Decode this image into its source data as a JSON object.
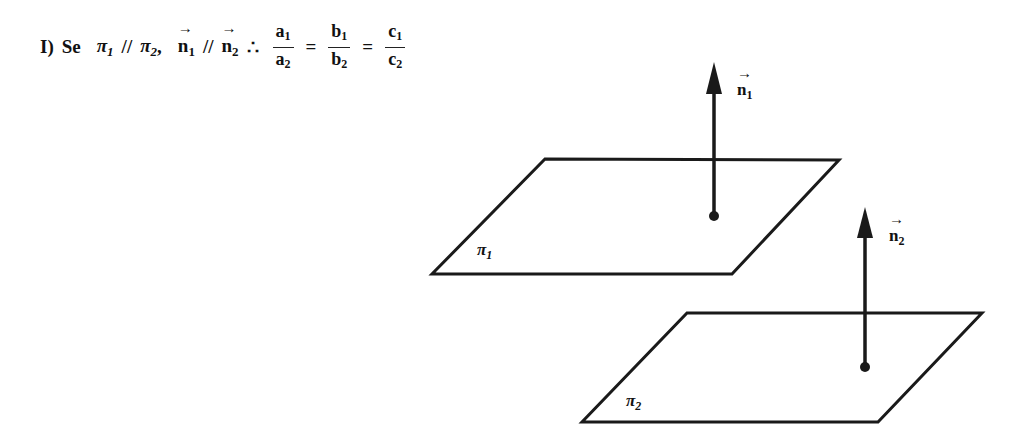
{
  "statement": {
    "item": "I)",
    "word": "Se",
    "pi": "π",
    "sub1": "1",
    "sub2": "2",
    "parallel": "//",
    "comma": ",",
    "normal": "n",
    "therefore": "∴",
    "equals": "=",
    "fractions": [
      {
        "num": "a",
        "den": "a"
      },
      {
        "num": "b",
        "den": "b"
      },
      {
        "num": "c",
        "den": "c"
      }
    ]
  },
  "figure": {
    "plane1_label": "π",
    "plane1_sub": "1",
    "plane2_label": "π",
    "plane2_sub": "2",
    "normal1_label": "n",
    "normal1_sub": "1",
    "normal2_label": "n",
    "normal2_sub": "2",
    "stroke_color": "#1a1a1a"
  }
}
